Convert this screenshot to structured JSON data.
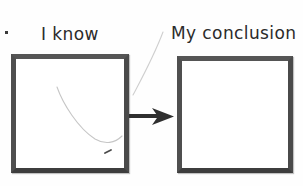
{
  "figure": {
    "title_left": "I know",
    "title_right": "My conclusion",
    "background_color": "#fefefe",
    "ink_color": "#3d3d3d",
    "faint_curve_color": "#c9c9c9",
    "arrow_color": "#2f2f2f"
  },
  "panels": [
    {
      "id": "known",
      "label": "I know",
      "content": "faint hand-drawn U-shaped curve",
      "empty": false
    },
    {
      "id": "conclusion",
      "label": "My conclusion",
      "content": "",
      "empty": true
    }
  ],
  "connector": {
    "name": "arrow",
    "direction": "left-to-right",
    "label": ""
  },
  "marks": {
    "corner_speck": "",
    "pen_tick": ""
  }
}
